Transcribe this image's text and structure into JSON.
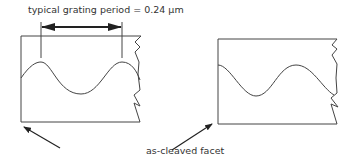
{
  "labels": {
    "period": "typical grating period = 0.24 μm",
    "facet": "as-cleaved facet"
  },
  "colors": {
    "line": "#444444",
    "text": "#333333",
    "background": "#ffffff"
  }
}
